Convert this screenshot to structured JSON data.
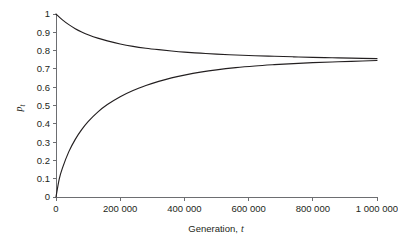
{
  "chart_data": {
    "type": "line",
    "title": "",
    "subtitle": "",
    "xlabel": "Generation, t",
    "xlabel_plain": "Generation,",
    "xlabel_italic": "t",
    "ylabel": "p_t",
    "ylabel_plain": "p",
    "ylabel_sub": "t",
    "xlim": [
      0,
      1000000
    ],
    "ylim": [
      0,
      1
    ],
    "grid": false,
    "legend": "none",
    "xticks": [
      0,
      200000,
      400000,
      600000,
      800000,
      1000000
    ],
    "xtick_labels": [
      "0",
      "200 000",
      "400 000",
      "600 000",
      "800 000",
      "1 000 000"
    ],
    "yticks": [
      0,
      0.1,
      0.2,
      0.3,
      0.4,
      0.5,
      0.6,
      0.7,
      0.8,
      0.9,
      1
    ],
    "ytick_labels": [
      "0",
      "0.1",
      "0.2",
      "0.3",
      "0.4",
      "0.5",
      "0.6",
      "0.7",
      "0.8",
      "0.9",
      "1"
    ],
    "equilibrium": 0.75,
    "line_color": "#231f20",
    "axis_color": "#6d6e71",
    "background_color": "#ffffff",
    "series": [
      {
        "name": "upper-trajectory",
        "start_value": 1.0,
        "end_value": 0.754,
        "x": [
          0,
          20000,
          40000,
          60000,
          80000,
          100000,
          130000,
          160000,
          200000,
          240000,
          280000,
          320000,
          360000,
          400000,
          450000,
          500000,
          560000,
          620000,
          680000,
          740000,
          800000,
          860000,
          920000,
          1000000
        ],
        "values": [
          1.0,
          0.968,
          0.942,
          0.92,
          0.902,
          0.887,
          0.868,
          0.853,
          0.836,
          0.823,
          0.813,
          0.805,
          0.798,
          0.792,
          0.786,
          0.781,
          0.776,
          0.772,
          0.769,
          0.766,
          0.763,
          0.761,
          0.759,
          0.756
        ]
      },
      {
        "name": "lower-trajectory",
        "start_value": 0.0,
        "end_value": 0.748,
        "x": [
          0,
          10000,
          20000,
          40000,
          60000,
          80000,
          100000,
          130000,
          160000,
          200000,
          240000,
          280000,
          320000,
          360000,
          400000,
          450000,
          500000,
          560000,
          620000,
          680000,
          740000,
          800000,
          860000,
          920000,
          1000000
        ],
        "values": [
          0.0,
          0.098,
          0.158,
          0.248,
          0.315,
          0.368,
          0.412,
          0.464,
          0.505,
          0.548,
          0.582,
          0.609,
          0.632,
          0.651,
          0.666,
          0.682,
          0.695,
          0.707,
          0.716,
          0.723,
          0.729,
          0.734,
          0.738,
          0.741,
          0.746
        ]
      }
    ]
  }
}
